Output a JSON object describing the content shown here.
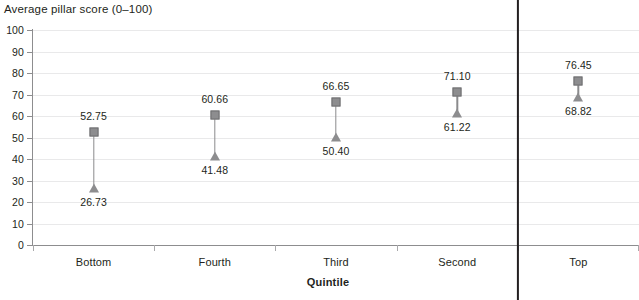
{
  "chart_data": {
    "type": "scatter",
    "title": "Average pillar score (0–100)",
    "xlabel": "Quintile",
    "ylabel": "",
    "categories": [
      "Bottom",
      "Fourth",
      "Third",
      "Second",
      "Top"
    ],
    "ylim": [
      0,
      100
    ],
    "yticks": [
      0,
      10,
      20,
      30,
      40,
      50,
      60,
      70,
      80,
      90,
      100
    ],
    "ytick_labels": [
      "0",
      "10",
      "20",
      "30",
      "40",
      "50",
      "60",
      "70",
      "80",
      "90",
      "100"
    ],
    "grid": true,
    "legend": "none",
    "series": [
      {
        "name": "upper",
        "marker": "square",
        "values": [
          52.75,
          60.66,
          66.65,
          71.1,
          76.45
        ],
        "labels": [
          "52.75",
          "60.66",
          "66.65",
          "71.10",
          "76.45"
        ],
        "label_position": "above"
      },
      {
        "name": "lower",
        "marker": "triangle",
        "values": [
          26.73,
          41.48,
          50.4,
          61.22,
          68.82
        ],
        "labels": [
          "26.73",
          "41.48",
          "50.40",
          "61.22",
          "68.82"
        ],
        "label_position": "below"
      }
    ],
    "annotations": [
      {
        "type": "vertical-divider",
        "after_category": "Second"
      }
    ],
    "colors": {
      "marker": "#8d8d8f",
      "connector": "#8b8b8d",
      "gridline": "#e9e9ea",
      "axis": "#8d8d8f",
      "divider": "#231f20",
      "text": "#231f20"
    }
  }
}
